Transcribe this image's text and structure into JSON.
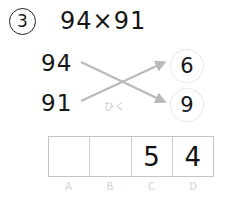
{
  "problem": {
    "number_label": "3",
    "expression": "94×91"
  },
  "operands": {
    "top": "94",
    "bottom": "91"
  },
  "operation_caption": "ひく",
  "results": {
    "top": "6",
    "bottom": "9"
  },
  "answer_table": {
    "cells": [
      {
        "label": "A",
        "value": ""
      },
      {
        "label": "B",
        "value": ""
      },
      {
        "label": "C",
        "value": "5"
      },
      {
        "label": "D",
        "value": "4"
      }
    ]
  },
  "colors": {
    "ink": "#161616",
    "arrow_gray": "#b9b9b9",
    "faint_gray": "#cfcfcf",
    "label_gray": "#d2d2d2",
    "table_border": "#c4c4c4",
    "background": "#ffffff"
  },
  "icons": {
    "arrow_up_right": "arrow-up-right-icon",
    "arrow_down_right": "arrow-down-right-icon"
  }
}
